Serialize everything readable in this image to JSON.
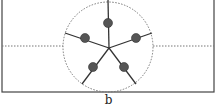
{
  "figure": {
    "label": "b",
    "colors": {
      "line": "#333333",
      "dot": "#555555",
      "dotted": "#777777",
      "frame": "#444444"
    },
    "frame": {
      "x": 2,
      "y": 0,
      "w": 212,
      "h": 92
    },
    "circle": {
      "cx": 108,
      "cy": 47,
      "r": 45
    },
    "center": {
      "x": 109,
      "y": 48
    },
    "spokes": [
      {
        "end": [
          108,
          0
        ],
        "dot": [
          108,
          23
        ]
      },
      {
        "end": [
          152,
          33
        ],
        "dot": [
          136,
          38
        ]
      },
      {
        "end": [
          136,
          84
        ],
        "dot": [
          124,
          67
        ]
      },
      {
        "end": [
          82,
          84
        ],
        "dot": [
          93,
          67
        ]
      },
      {
        "end": [
          65,
          33
        ],
        "dot": [
          85,
          38
        ]
      }
    ],
    "dotted_line_y": 46
  }
}
